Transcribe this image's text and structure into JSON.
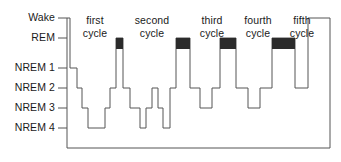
{
  "figure": {
    "width": 341,
    "height": 162,
    "background_color": "#ffffff",
    "line_color": "#555555",
    "rem_fill_color": "#2b2b2b",
    "text_color": "#1a1a1a"
  },
  "axis": {
    "labels": [
      {
        "text": "Wake",
        "y": 18,
        "stage": "Wake"
      },
      {
        "text": "REM",
        "y": 38,
        "stage": "REM"
      },
      {
        "text": "NREM 1",
        "y": 68,
        "stage": "NREM1"
      },
      {
        "text": "NREM 2",
        "y": 88,
        "stage": "NREM2"
      },
      {
        "text": "NREM 3",
        "y": 108,
        "stage": "NREM3"
      },
      {
        "text": "NREM 4",
        "y": 128,
        "stage": "NREM4"
      }
    ],
    "axis_x": 67,
    "tick_length": 9,
    "baseline_y": 148,
    "right_edge_x": 330
  },
  "cycles": [
    {
      "line1": "first",
      "line2": "cycle",
      "center_x": 95,
      "top_y": 14
    },
    {
      "line1": "second",
      "line2": "cycle",
      "center_x": 152,
      "top_y": 14
    },
    {
      "line1": "third",
      "line2": "cycle",
      "center_x": 212,
      "top_y": 14
    },
    {
      "line1": "fourth",
      "line2": "cycle",
      "center_x": 258,
      "top_y": 14
    },
    {
      "line1": "fifth",
      "line2": "cycle",
      "center_x": 302,
      "top_y": 14
    }
  ],
  "chart_data": {
    "type": "line",
    "xlabel": "",
    "ylabel": "",
    "grid": false,
    "legend": "none",
    "stage_levels": {
      "Wake": 18,
      "REM": 38,
      "NREM1": 68,
      "NREM2": 88,
      "NREM3": 108,
      "NREM4": 128
    },
    "y_categories": [
      "Wake",
      "REM",
      "NREM 1",
      "NREM 2",
      "NREM 3",
      "NREM 4"
    ],
    "x_range": [
      67,
      330
    ],
    "hypnogram_steps": [
      {
        "x_start": 67,
        "x_end": 70,
        "stage": "Wake"
      },
      {
        "x_start": 70,
        "x_end": 77,
        "stage": "NREM1"
      },
      {
        "x_start": 77,
        "x_end": 82,
        "stage": "NREM2"
      },
      {
        "x_start": 82,
        "x_end": 88,
        "stage": "NREM3"
      },
      {
        "x_start": 88,
        "x_end": 105,
        "stage": "NREM4"
      },
      {
        "x_start": 105,
        "x_end": 110,
        "stage": "NREM3"
      },
      {
        "x_start": 110,
        "x_end": 116,
        "stage": "NREM2"
      },
      {
        "x_start": 116,
        "x_end": 123,
        "stage": "REM"
      },
      {
        "x_start": 123,
        "x_end": 130,
        "stage": "NREM2"
      },
      {
        "x_start": 130,
        "x_end": 140,
        "stage": "NREM3"
      },
      {
        "x_start": 140,
        "x_end": 146,
        "stage": "NREM4"
      },
      {
        "x_start": 146,
        "x_end": 152,
        "stage": "NREM3"
      },
      {
        "x_start": 152,
        "x_end": 158,
        "stage": "NREM2"
      },
      {
        "x_start": 158,
        "x_end": 163,
        "stage": "NREM3"
      },
      {
        "x_start": 163,
        "x_end": 170,
        "stage": "NREM4"
      },
      {
        "x_start": 170,
        "x_end": 176,
        "stage": "NREM2"
      },
      {
        "x_start": 176,
        "x_end": 190,
        "stage": "REM"
      },
      {
        "x_start": 190,
        "x_end": 200,
        "stage": "NREM2"
      },
      {
        "x_start": 200,
        "x_end": 212,
        "stage": "NREM3"
      },
      {
        "x_start": 212,
        "x_end": 220,
        "stage": "NREM2"
      },
      {
        "x_start": 220,
        "x_end": 236,
        "stage": "REM"
      },
      {
        "x_start": 236,
        "x_end": 248,
        "stage": "NREM2"
      },
      {
        "x_start": 248,
        "x_end": 260,
        "stage": "NREM3"
      },
      {
        "x_start": 260,
        "x_end": 272,
        "stage": "NREM2"
      },
      {
        "x_start": 272,
        "x_end": 295,
        "stage": "REM"
      },
      {
        "x_start": 295,
        "x_end": 308,
        "stage": "NREM2"
      },
      {
        "x_start": 308,
        "x_end": 330,
        "stage": "Wake"
      }
    ],
    "rem_blocks": [
      {
        "x_start": 116,
        "x_end": 123,
        "stage": "REM",
        "cycle": "first"
      },
      {
        "x_start": 176,
        "x_end": 190,
        "stage": "REM",
        "cycle": "second"
      },
      {
        "x_start": 220,
        "x_end": 236,
        "stage": "REM",
        "cycle": "third"
      },
      {
        "x_start": 272,
        "x_end": 295,
        "stage": "REM",
        "cycle": "fourth"
      }
    ],
    "rem_block_height": 11
  }
}
